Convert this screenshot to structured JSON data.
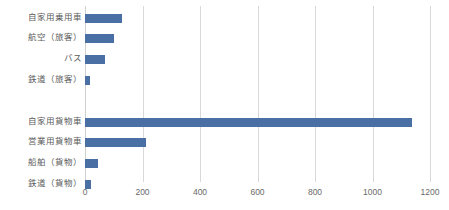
{
  "chart_data": {
    "type": "bar",
    "orientation": "horizontal",
    "title": "",
    "subtitle": "",
    "xlabel": "",
    "ylabel": "",
    "grid": true,
    "legend": false,
    "legend_position": "none",
    "xlim": [
      0,
      1200
    ],
    "xticks": [
      0,
      200,
      400,
      600,
      800,
      1000,
      1200
    ],
    "xtick_labels": [
      "0",
      "200",
      "400",
      "600",
      "800",
      "1000",
      "1200"
    ],
    "bar_color": "#4a6fa5",
    "gridline_color": "#d9d9d9",
    "label_color": "#5a5a5a",
    "categories": [
      "自家用乗用車",
      "航空（旅客）",
      "バス",
      "鉄道（旅客）",
      "",
      "自家用貨物車",
      "営業用貨物車",
      "船舶（貨物）",
      "鉄道（貨物）"
    ],
    "values": [
      129,
      101,
      70,
      17,
      null,
      1137,
      212,
      45,
      21
    ],
    "series": [
      {
        "name": "",
        "values": [
          129,
          101,
          70,
          17,
          null,
          1137,
          212,
          45,
          21
        ]
      }
    ]
  }
}
